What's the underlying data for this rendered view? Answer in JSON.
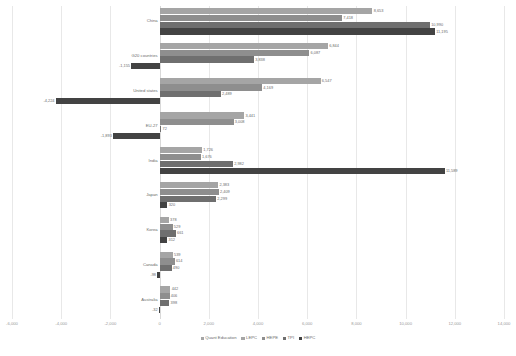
{
  "chart_data": {
    "type": "bar",
    "orientation": "horizontal",
    "title": "",
    "subtitle": "",
    "xlabel": "",
    "ylabel": "",
    "xlim": [
      -6000,
      14000
    ],
    "grid": true,
    "legend_position": "bottom",
    "xticks": [
      "-6,000",
      "-4,000",
      "-2,000",
      "0",
      "2,000",
      "4,000",
      "6,000",
      "8,000",
      "10,000",
      "12,000",
      "14,000"
    ],
    "xtick_values": [
      -6000,
      -4000,
      -2000,
      0,
      2000,
      4000,
      6000,
      8000,
      10000,
      12000,
      14000
    ],
    "categories": [
      "China",
      "G20 countries",
      "United states",
      "EU-27",
      "India",
      "Japan",
      "Korea",
      "Canada",
      "Australia"
    ],
    "series": [
      {
        "name": "Quant Education",
        "color": "#a5a5a5",
        "values": [
          8653,
          6844,
          6547,
          3441,
          1726,
          2383,
          378,
          539,
          442
        ],
        "labels": [
          "8,653",
          "6,844",
          "6,547",
          "3,441",
          "1,726",
          "2,383",
          "378",
          "539",
          "442"
        ]
      },
      {
        "name": "LEPC",
        "color": "#8e8e8e",
        "values": [
          7418,
          6087,
          4169,
          3008,
          1676,
          2409,
          529,
          614,
          406
        ],
        "labels": [
          "7,418",
          "6,087",
          "4,169",
          "3,008",
          "1,676",
          "2,409",
          "529",
          "614",
          "406"
        ]
      },
      {
        "name": "HEPE",
        "color": "#6f6f6f",
        "values": [
          10990,
          3838,
          2489,
          72,
          2982,
          2299,
          661,
          490,
          398
        ],
        "labels": [
          "10,990",
          "3,838",
          "2,489",
          "72",
          "2,982",
          "2,299",
          "661",
          "490",
          "398"
        ]
      },
      {
        "name": "TPI",
        "color": "#434343",
        "values": [
          11195,
          -1155,
          -4224,
          -1893,
          11589,
          320,
          312,
          -98,
          -32
        ],
        "labels": [
          "11,195",
          "-1,155",
          "-4,224",
          "-1,893",
          "11,589",
          "320",
          "312",
          "-98",
          "-32"
        ]
      }
    ],
    "legend_entries": [
      "Quant Education",
      "LEPC",
      "HEPE",
      "TPI",
      "HEPC"
    ]
  }
}
